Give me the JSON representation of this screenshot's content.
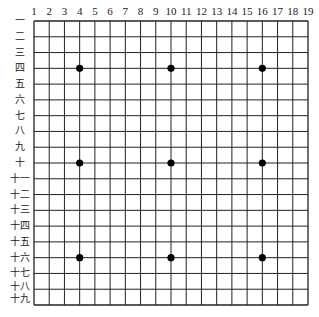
{
  "board": {
    "size": 19,
    "line_color": "#222222",
    "border_color": "#222222",
    "background": "#ffffff",
    "star_color": "#000000",
    "origin_x": 34,
    "origin_y": 21,
    "end_x": 308,
    "end_y": 305
  },
  "column_labels": [
    "1",
    "2",
    "3",
    "4",
    "5",
    "6",
    "7",
    "8",
    "9",
    "10",
    "11",
    "12",
    "13",
    "14",
    "15",
    "16",
    "17",
    "18",
    "19"
  ],
  "row_labels": [
    "一",
    "二",
    "三",
    "四",
    "五",
    "六",
    "七",
    "八",
    "九",
    "十",
    "十一",
    "十二",
    "十三",
    "十四",
    "十五",
    "十六",
    "十七",
    "十八",
    "十九"
  ],
  "star_points": [
    {
      "col": 4,
      "row": 4
    },
    {
      "col": 10,
      "row": 4
    },
    {
      "col": 16,
      "row": 4
    },
    {
      "col": 4,
      "row": 10
    },
    {
      "col": 10,
      "row": 10
    },
    {
      "col": 16,
      "row": 10
    },
    {
      "col": 4,
      "row": 16
    },
    {
      "col": 10,
      "row": 16
    },
    {
      "col": 16,
      "row": 16
    }
  ]
}
